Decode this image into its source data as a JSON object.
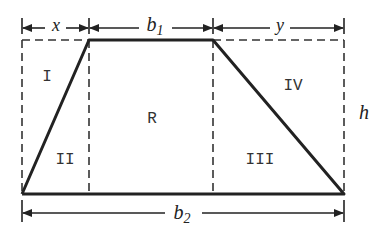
{
  "diagram": {
    "colors": {
      "stroke": "#222222",
      "background": "#ffffff",
      "text": "#333333"
    },
    "dimensions": {
      "top_left": {
        "label": "x",
        "sub": ""
      },
      "top_middle": {
        "label": "b",
        "sub": "1"
      },
      "top_right": {
        "label": "y",
        "sub": ""
      },
      "bottom": {
        "label": "b",
        "sub": "2"
      },
      "height": {
        "label": "h",
        "sub": ""
      }
    },
    "regions": [
      {
        "id": "I",
        "label": "I"
      },
      {
        "id": "II",
        "label": "II"
      },
      {
        "id": "R",
        "label": "R"
      },
      {
        "id": "III",
        "label": "III"
      },
      {
        "id": "IV",
        "label": "IV"
      }
    ]
  }
}
